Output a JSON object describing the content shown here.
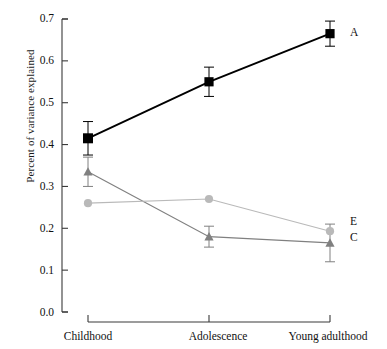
{
  "chart_data": {
    "type": "line",
    "title": "",
    "xlabel": "",
    "ylabel": "Percent of variance explained",
    "categories": [
      "Childhood",
      "Adolescence",
      "Young adulthood"
    ],
    "ylim": [
      0.0,
      0.7
    ],
    "yticks": [
      "0.0",
      "0.1",
      "0.2",
      "0.3",
      "0.4",
      "0.5",
      "0.6",
      "0.7"
    ],
    "ytick_values": [
      0.0,
      0.1,
      0.2,
      0.3,
      0.4,
      0.5,
      0.6,
      0.7
    ],
    "grid": false,
    "legend_position": "right-inline",
    "series": [
      {
        "name": "A",
        "label": "A",
        "color": "#000000",
        "marker": "square",
        "values": [
          0.415,
          0.55,
          0.665
        ],
        "errors": [
          0.04,
          0.035,
          0.03
        ]
      },
      {
        "name": "C",
        "label": "C",
        "color": "#808080",
        "marker": "triangle",
        "values": [
          0.335,
          0.18,
          0.165
        ],
        "errors": [
          0.035,
          0.025,
          0.045
        ]
      },
      {
        "name": "E",
        "label": "E",
        "color": "#b9b9b9",
        "marker": "circle",
        "values": [
          0.26,
          0.27,
          0.193
        ],
        "errors": [
          0.0,
          0.0,
          0.0
        ]
      }
    ]
  },
  "axis": {
    "y_title": "Percent of variance explained",
    "tick_0": "0.0",
    "tick_1": "0.1",
    "tick_2": "0.2",
    "tick_3": "0.3",
    "tick_4": "0.4",
    "tick_5": "0.5",
    "tick_6": "0.6",
    "tick_7": "0.7",
    "x_0": "Childhood",
    "x_1": "Adolescence",
    "x_2": "Young adulthood"
  },
  "labels": {
    "a": "A",
    "c": "C",
    "e": "E"
  },
  "colors": {
    "series_a": "#000000",
    "series_c": "#808080",
    "series_e": "#b9b9b9",
    "axis": "#3a3a3a",
    "text": "#111111"
  }
}
